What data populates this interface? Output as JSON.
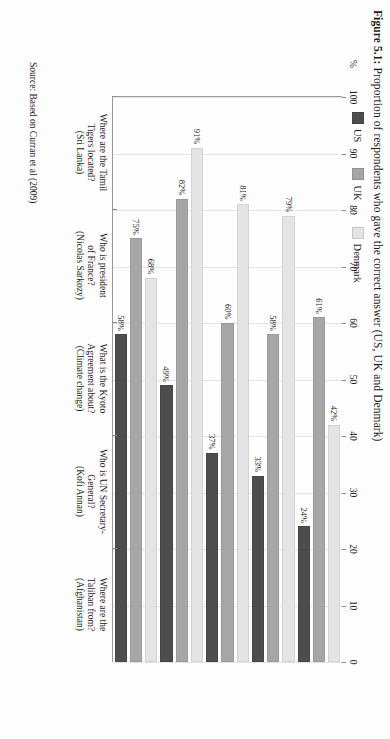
{
  "figure": {
    "label": "Figure 5.1:",
    "caption": "Proportion of respondents who gave the correct answer (US, UK and Denmark)",
    "source": "Source: Based on Curran et al (2009)"
  },
  "legend": {
    "position": "top",
    "items": [
      {
        "name": "US",
        "color": "#4d4d4d"
      },
      {
        "name": "UK",
        "color": "#a6a6a6"
      },
      {
        "name": "Denmark",
        "color": "#e4e4e4"
      }
    ]
  },
  "axis": {
    "y_title": "%",
    "ticks": [
      "100",
      "90",
      "80",
      "70",
      "60",
      "50",
      "40",
      "30",
      "20",
      "10",
      "0"
    ]
  },
  "chart_data": {
    "type": "bar",
    "orientation": "horizontal",
    "title": "Figure 5.1: Proportion of respondents who gave the correct answer (US, UK and Denmark)",
    "xlabel": "",
    "ylabel": "%",
    "ylim": [
      0,
      100
    ],
    "grid": true,
    "legend_position": "top",
    "categories": [
      "Where are the Tamil Tigers located? (Sri Lanka)",
      "Who is president of France? (Nicolas Sarkozy)",
      "What is the Kyoto Agreement about? (Climate change)",
      "Who is UN Secretary-General? (Kofi Annan)",
      "Where are the Taliban from? (Afghanistan)"
    ],
    "category_lines": [
      [
        "Where are the Tamil",
        "Tigers located?",
        "(Sri Lanka)"
      ],
      [
        "Who is president",
        "of France?",
        "(Nicolas Sarkozy)"
      ],
      [
        "What is the Kyoto",
        "Agreement about?",
        "(Climate change)"
      ],
      [
        "Who is UN Secretary-",
        "General?",
        "(Kofi Annan)"
      ],
      [
        "Where are the",
        "Taliban from?",
        "(Afghanistan)"
      ]
    ],
    "series": [
      {
        "name": "US",
        "color": "#4d4d4d",
        "values": [
          24,
          33,
          37,
          49,
          58
        ],
        "labels": [
          "24%",
          "33%",
          "37%",
          "49%",
          "58%"
        ]
      },
      {
        "name": "UK",
        "color": "#a6a6a6",
        "values": [
          61,
          58,
          60,
          82,
          75
        ],
        "labels": [
          "61%",
          "58%",
          "60%",
          "82%",
          "75%"
        ]
      },
      {
        "name": "Denmark",
        "color": "#e4e4e4",
        "values": [
          42,
          79,
          81,
          91,
          68
        ],
        "labels": [
          "42%",
          "79%",
          "81%",
          "91%",
          "68%"
        ]
      }
    ],
    "source": "Source: Based on Curran et al (2009)"
  }
}
